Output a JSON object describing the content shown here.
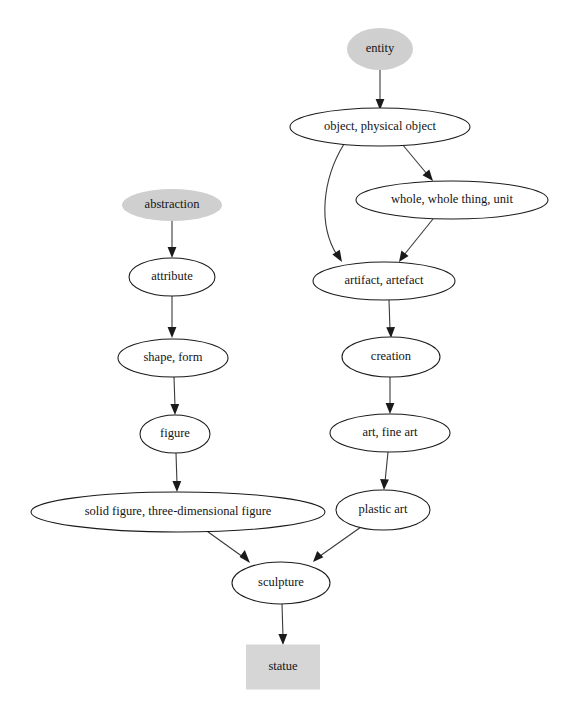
{
  "diagram": {
    "background_color": "#ffffff",
    "edge_color": "#3a3a3a",
    "node_fill": "#ffffff",
    "node_stroke": "#1a1a1a",
    "shaded_fill": "#cfcfcf",
    "box_fill": "#d6d6d6",
    "nodes": [
      {
        "id": "entity",
        "label": "entity",
        "shape": "ellipse",
        "style": "shaded",
        "cx": 380,
        "cy": 49,
        "rx": 33,
        "ry": 21
      },
      {
        "id": "object",
        "label": "object, physical object",
        "shape": "ellipse",
        "style": "plain",
        "cx": 380,
        "cy": 127,
        "rx": 90,
        "ry": 19
      },
      {
        "id": "whole",
        "label": "whole, whole thing, unit",
        "shape": "ellipse",
        "style": "plain",
        "cx": 452,
        "cy": 200,
        "rx": 96,
        "ry": 19
      },
      {
        "id": "artifact",
        "label": "artifact, artefact",
        "shape": "ellipse",
        "style": "plain",
        "cx": 384,
        "cy": 281,
        "rx": 71,
        "ry": 19
      },
      {
        "id": "creation",
        "label": "creation",
        "shape": "ellipse",
        "style": "plain",
        "cx": 391,
        "cy": 357,
        "rx": 49,
        "ry": 20
      },
      {
        "id": "art",
        "label": "art, fine art",
        "shape": "ellipse",
        "style": "plain",
        "cx": 390,
        "cy": 433,
        "rx": 60,
        "ry": 19
      },
      {
        "id": "plastic_art",
        "label": "plastic art",
        "shape": "ellipse",
        "style": "plain",
        "cx": 383,
        "cy": 510,
        "rx": 47,
        "ry": 20
      },
      {
        "id": "abstraction",
        "label": "abstraction",
        "shape": "ellipse",
        "style": "shaded",
        "cx": 172,
        "cy": 205,
        "rx": 50,
        "ry": 16
      },
      {
        "id": "attribute",
        "label": "attribute",
        "shape": "ellipse",
        "style": "plain",
        "cx": 172,
        "cy": 277,
        "rx": 43,
        "ry": 19
      },
      {
        "id": "shape_form",
        "label": "shape, form",
        "shape": "ellipse",
        "style": "plain",
        "cx": 173,
        "cy": 358,
        "rx": 55,
        "ry": 19
      },
      {
        "id": "figure",
        "label": "figure",
        "shape": "ellipse",
        "style": "plain",
        "cx": 175,
        "cy": 434,
        "rx": 35,
        "ry": 19
      },
      {
        "id": "solid_figure",
        "label": "solid figure, three-dimensional figure",
        "shape": "ellipse",
        "style": "plain",
        "cx": 178,
        "cy": 512,
        "rx": 147,
        "ry": 20
      },
      {
        "id": "sculpture",
        "label": "sculpture",
        "shape": "ellipse",
        "style": "plain",
        "cx": 281,
        "cy": 583,
        "rx": 49,
        "ry": 21
      },
      {
        "id": "statue",
        "label": "statue",
        "shape": "rect",
        "style": "box",
        "cx": 283,
        "cy": 667,
        "width": 74,
        "height": 45
      }
    ],
    "edges": [
      {
        "from": "entity",
        "to": "object"
      },
      {
        "from": "object",
        "to": "whole"
      },
      {
        "from": "object",
        "to": "artifact"
      },
      {
        "from": "whole",
        "to": "artifact"
      },
      {
        "from": "artifact",
        "to": "creation"
      },
      {
        "from": "creation",
        "to": "art"
      },
      {
        "from": "art",
        "to": "plastic_art"
      },
      {
        "from": "plastic_art",
        "to": "sculpture"
      },
      {
        "from": "abstraction",
        "to": "attribute"
      },
      {
        "from": "attribute",
        "to": "shape_form"
      },
      {
        "from": "shape_form",
        "to": "figure"
      },
      {
        "from": "figure",
        "to": "solid_figure"
      },
      {
        "from": "solid_figure",
        "to": "sculpture"
      },
      {
        "from": "sculpture",
        "to": "statue"
      }
    ]
  }
}
